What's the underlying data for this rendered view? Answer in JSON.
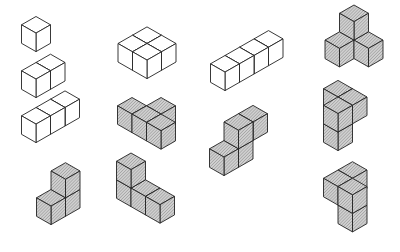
{
  "diagram": {
    "cube": {
      "half_width": 14.5,
      "half_height": 8.3,
      "edge": 18.5
    },
    "colors": {
      "stroke": "#222222",
      "outline_fill": "#ffffff",
      "shaded_fill": "#c8c8c8",
      "hatch": "#8a8a8a"
    },
    "pieces": [
      {
        "name": "monocube",
        "shaded": false,
        "origin": [
          36,
          35
        ],
        "cubes": [
          [
            0,
            0,
            0
          ]
        ]
      },
      {
        "name": "dicube-line",
        "shaded": false,
        "origin": [
          36,
          81
        ],
        "cubes": [
          [
            0,
            0,
            0
          ],
          [
            0,
            -1,
            0
          ]
        ]
      },
      {
        "name": "tricube-line",
        "shaded": false,
        "origin": [
          36,
          126
        ],
        "cubes": [
          [
            0,
            0,
            0
          ],
          [
            0,
            -1,
            0
          ],
          [
            0,
            -2,
            0
          ]
        ]
      },
      {
        "name": "tricube-bent-corner",
        "shaded": true,
        "origin": [
          51,
          208
        ],
        "cubes": [
          [
            0,
            0,
            0
          ],
          [
            0,
            -1,
            0
          ],
          [
            0,
            -1,
            1
          ]
        ]
      },
      {
        "name": "tetracube-square",
        "shaded": false,
        "origin": [
          147,
          62
        ],
        "cubes": [
          [
            -1,
            -1,
            0
          ],
          [
            -1,
            0,
            0
          ],
          [
            0,
            -1,
            0
          ],
          [
            0,
            0,
            0
          ]
        ]
      },
      {
        "name": "tetracube-t",
        "shaded": true,
        "origin": [
          132,
          116
        ],
        "cubes": [
          [
            1,
            -1,
            0
          ],
          [
            0,
            0,
            0
          ],
          [
            1,
            0,
            0
          ],
          [
            2,
            0,
            0
          ]
        ]
      },
      {
        "name": "tetracube-l",
        "shaded": true,
        "origin": [
          131,
          190
        ],
        "cubes": [
          [
            0,
            0,
            0
          ],
          [
            0,
            0,
            1
          ],
          [
            1,
            0,
            0
          ],
          [
            2,
            0,
            0
          ]
        ]
      },
      {
        "name": "tetracube-line",
        "shaded": false,
        "origin": [
          225,
          74
        ],
        "cubes": [
          [
            0,
            -3,
            0
          ],
          [
            0,
            -2,
            0
          ],
          [
            0,
            -1,
            0
          ],
          [
            0,
            0,
            0
          ]
        ]
      },
      {
        "name": "tetracube-skew",
        "shaded": true,
        "origin": [
          224,
          159
        ],
        "cubes": [
          [
            0,
            -2,
            1
          ],
          [
            0,
            0,
            0
          ],
          [
            0,
            -1,
            0
          ],
          [
            0,
            -1,
            1
          ]
        ]
      },
      {
        "name": "tetracube-tripod",
        "shaded": true,
        "origin": [
          354,
          42
        ],
        "cubes": [
          [
            0,
            0,
            1
          ],
          [
            0,
            1,
            0
          ],
          [
            1,
            0,
            0
          ]
        ]
      },
      {
        "name": "tetracube-chiral-a",
        "shaded": true,
        "origin": [
          338,
          134
        ],
        "cubes": [
          [
            -1,
            -1,
            1
          ],
          [
            0,
            -1,
            1
          ],
          [
            0,
            0,
            0
          ],
          [
            0,
            0,
            1
          ]
        ]
      },
      {
        "name": "tetracube-chiral-b",
        "shaded": true,
        "origin": [
          338,
          207
        ],
        "cubes": [
          [
            0,
            -1,
            1
          ],
          [
            0,
            0,
            1
          ],
          [
            1,
            0,
            0
          ],
          [
            1,
            0,
            1
          ]
        ]
      }
    ]
  }
}
